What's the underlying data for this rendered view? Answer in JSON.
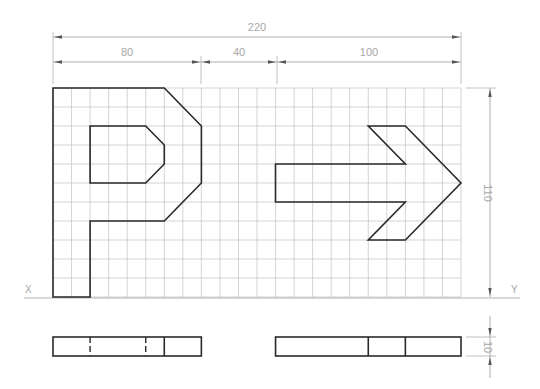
{
  "drawing": {
    "type": "orthographic-projection-exercise",
    "units_per_cell": 10,
    "grid": {
      "cols": 22,
      "rows": 11,
      "x0": 53,
      "y0": 88,
      "x1": 461,
      "y1": 297
    },
    "dimensions": {
      "overall_width": "220",
      "segment_1": "80",
      "segment_2": "40",
      "segment_3": "100",
      "height": "110",
      "thickness": "10"
    },
    "axis_labels": {
      "left": "X",
      "right": "Y"
    },
    "shapes": {
      "p_outer": [
        [
          0,
          0
        ],
        [
          6,
          0
        ],
        [
          8,
          2
        ],
        [
          8,
          5
        ],
        [
          6,
          7
        ],
        [
          2,
          7
        ],
        [
          2,
          11
        ],
        [
          0,
          11
        ]
      ],
      "p_inner": [
        [
          2,
          2
        ],
        [
          5,
          2
        ],
        [
          6,
          3
        ],
        [
          6,
          4
        ],
        [
          5,
          5
        ],
        [
          2,
          5
        ]
      ],
      "arrow": [
        [
          12,
          4
        ],
        [
          19,
          4
        ],
        [
          17,
          2
        ],
        [
          19,
          2
        ],
        [
          22,
          5
        ],
        [
          19,
          8
        ],
        [
          17,
          8
        ],
        [
          19,
          6
        ],
        [
          12,
          6
        ]
      ]
    },
    "bottom_views": {
      "left": {
        "from_col": 0,
        "to_col": 8,
        "solid_cols": [
          6
        ],
        "hidden_cols": [
          2,
          5
        ]
      },
      "right": {
        "from_col": 12,
        "to_col": 22,
        "solid_cols": [
          17,
          19
        ],
        "hidden_cols": []
      }
    },
    "colors": {
      "outline": "#2a2a2a",
      "grid": "#c8c8c8",
      "dimension": "#9a9a9a",
      "text": "#a8a8a8"
    }
  }
}
